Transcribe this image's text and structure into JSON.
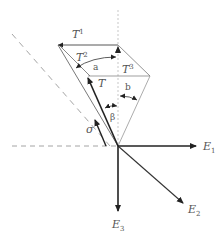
{
  "diagram": {
    "vectors": {
      "T1": {
        "base": "T",
        "sup": "1"
      },
      "T2": {
        "base": "T",
        "sup": "2"
      },
      "T3": {
        "base": "T",
        "sup": "3"
      },
      "T": {
        "base": "T"
      },
      "sigma": {
        "base": "σ"
      }
    },
    "angles": {
      "a": "a",
      "b": "b",
      "beta": "β"
    },
    "axes": {
      "E1": {
        "base": "E",
        "sub": "1"
      },
      "E2": {
        "base": "E",
        "sub": "2"
      },
      "E3": {
        "base": "E",
        "sub": "3"
      }
    },
    "colors": {
      "line": "#333333",
      "thin": "#888888",
      "dashed": "#999999",
      "label": "#555555"
    }
  }
}
